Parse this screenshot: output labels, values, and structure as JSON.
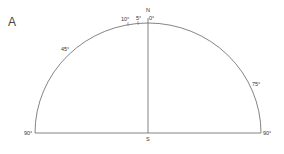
{
  "panel_label": "A",
  "labels": {
    "north": "N",
    "south": "S",
    "deg_0": "0°",
    "deg_5": "5°",
    "deg_10": "10°",
    "deg_45": "45°",
    "deg_75": "75°",
    "deg_90_left": "90°",
    "deg_90_right": "90°"
  },
  "colors": {
    "line": "#555555",
    "text": "#333333",
    "background": "#ffffff"
  }
}
